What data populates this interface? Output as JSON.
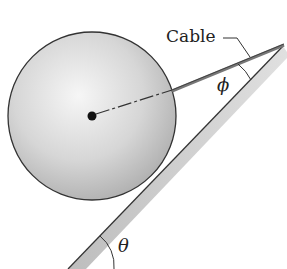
{
  "diagram": {
    "labels": {
      "cable": "Cable",
      "phi": "ϕ",
      "theta": "θ"
    },
    "colors": {
      "outline": "#3a3a3a",
      "sphere_highlight": "#f4f4f4",
      "sphere_shadow": "#a8a8a8",
      "incline_fill": "#c8c8c8",
      "cable": "#555555",
      "background": "#ffffff"
    }
  }
}
